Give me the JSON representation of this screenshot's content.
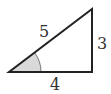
{
  "diagram": {
    "type": "right-triangle",
    "labels": {
      "hypotenuse": "5",
      "vertical_leg": "3",
      "horizontal_leg": "4"
    },
    "colors": {
      "stroke": "#222222",
      "angle_fill": "#d9d9d9",
      "text": "#333333"
    }
  }
}
